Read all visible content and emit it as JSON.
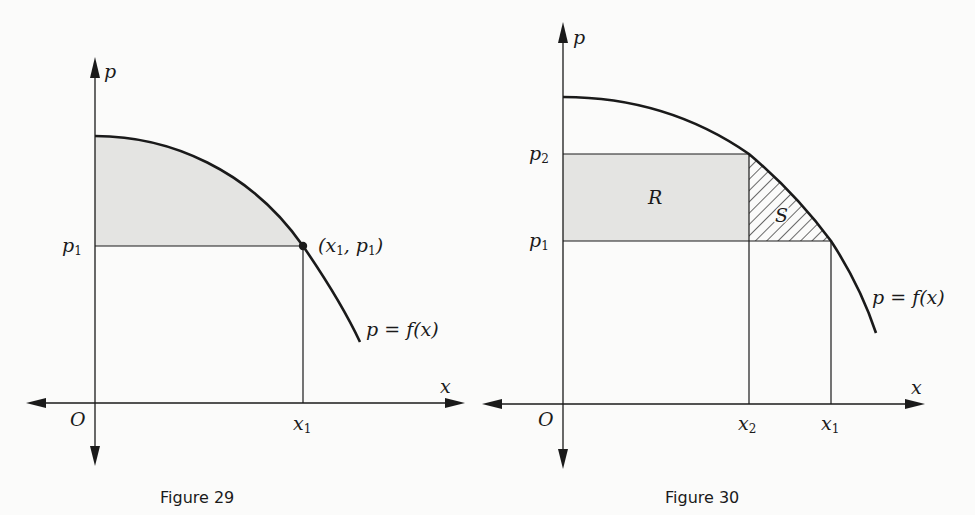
{
  "top_text_fragment": "…",
  "figures": [
    {
      "caption": "Figure 29",
      "axes": {
        "x_label": "x",
        "y_label": "p",
        "origin_label": "O"
      },
      "ticks": {
        "x": [
          "x1"
        ],
        "p": [
          "p1"
        ]
      },
      "labels": {
        "point": "(x1, p1)",
        "curve": "p = f(x)"
      },
      "shaded_region": "area under curve above p1 from 0 to x1"
    },
    {
      "caption": "Figure 30",
      "axes": {
        "x_label": "x",
        "y_label": "p",
        "origin_label": "O"
      },
      "ticks": {
        "x": [
          "x2",
          "x1"
        ],
        "p": [
          "p2",
          "p1"
        ]
      },
      "labels": {
        "region_R": "R",
        "region_S": "S",
        "curve": "p = f(x)"
      }
    }
  ],
  "text": {
    "f29_p": "p",
    "f29_x": "x",
    "f29_O": "O",
    "f29_p1_main": "p",
    "f29_p1_sub": "1",
    "f29_x1_main": "x",
    "f29_x1_sub": "1",
    "f29_point_a": "(x",
    "f29_point_b": "1",
    "f29_point_c": ", p",
    "f29_point_d": "1",
    "f29_point_e": ")",
    "f29_curve": "p = f(x)",
    "f29_caption": "Figure 29",
    "f30_p": "p",
    "f30_x": "x",
    "f30_O": "O",
    "f30_p2_main": "p",
    "f30_p2_sub": "2",
    "f30_p1_main": "p",
    "f30_p1_sub": "1",
    "f30_x2_main": "x",
    "f30_x2_sub": "2",
    "f30_x1_main": "x",
    "f30_x1_sub": "1",
    "f30_R": "R",
    "f30_S": "S",
    "f30_curve": "p = f(x)",
    "f30_caption": "Figure 30"
  },
  "colors": {
    "ink": "#1a1a1a",
    "shade": "#e4e4e2",
    "paper": "#fbfbfa"
  }
}
